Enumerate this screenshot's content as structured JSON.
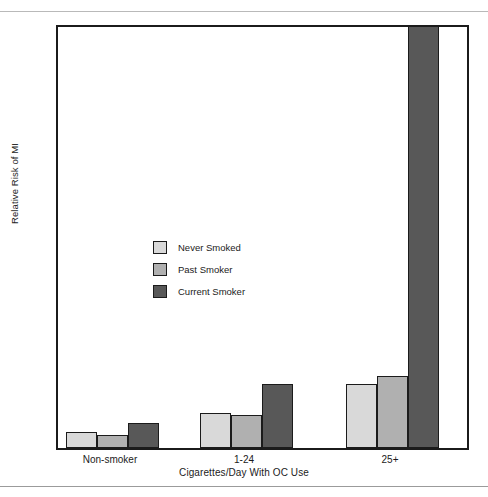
{
  "chart_data": {
    "type": "bar",
    "title": "",
    "xlabel": "Cigarettes/Day With OC Use",
    "ylabel": "Relative Risk of MI",
    "categories": [
      "Non-smoker",
      "1-24",
      "25+"
    ],
    "ylim": [
      0,
      30
    ],
    "yticks": [
      0,
      5,
      10,
      15,
      20,
      25,
      30
    ],
    "ytick_labels": [
      "0",
      "5",
      "10",
      "15",
      "20",
      "25",
      "30"
    ],
    "grid": false,
    "legend_position": "inside-left",
    "series": [
      {
        "name": "Never Smoked",
        "color": "#d9d9d9",
        "values": [
          1.1,
          2.5,
          4.5
        ],
        "clipped": [
          false,
          false,
          false
        ]
      },
      {
        "name": "Past Smoker",
        "color": "#b0b0b0",
        "values": [
          0.9,
          2.3,
          5.1
        ],
        "clipped": [
          false,
          false,
          false
        ]
      },
      {
        "name": "Current Smoker",
        "color": "#585858",
        "values": [
          1.8,
          4.5,
          30
        ],
        "clipped": [
          false,
          false,
          true
        ]
      }
    ]
  },
  "axis": {
    "y_title": "Relative Risk of MI",
    "x_title": "Cigarettes/Day With OC Use"
  },
  "legend": {
    "items": [
      {
        "label": "Never Smoked",
        "color": "#d9d9d9"
      },
      {
        "label": "Past Smoker",
        "color": "#b0b0b0"
      },
      {
        "label": "Current Smoker",
        "color": "#585858"
      }
    ]
  },
  "colors": {
    "axis": "#1b1b1b",
    "background": "#ffffff",
    "rule": "#b9b9b9"
  }
}
